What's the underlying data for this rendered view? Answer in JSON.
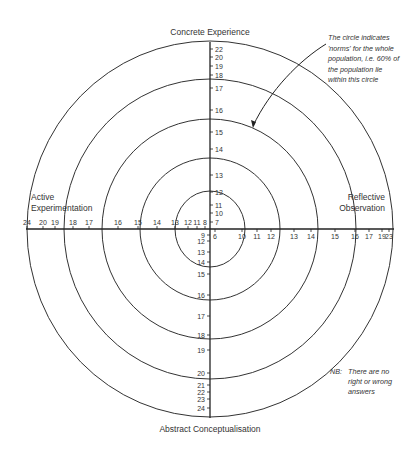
{
  "diagram": {
    "type": "learning-style-target",
    "center": {
      "x": 210,
      "y": 229
    },
    "circles": [
      {
        "rx": 35,
        "ry": 38
      },
      {
        "rx": 70,
        "ry": 71
      },
      {
        "rx": 108,
        "ry": 110
      },
      {
        "rx": 146,
        "ry": 150
      },
      {
        "rx": 183,
        "ry": 188
      }
    ],
    "axis_labels": {
      "top": "Concrete Experience",
      "bottom": "Abstract Conceptualisation",
      "left_line1": "Active",
      "left_line2": "Experimentation",
      "right_line1": "Reflective",
      "right_line2": "Observation"
    },
    "ticks": {
      "top": [
        {
          "label": "22",
          "y": 49
        },
        {
          "label": "20",
          "y": 57
        },
        {
          "label": "19",
          "y": 66
        },
        {
          "label": "18",
          "y": 75
        },
        {
          "label": "17",
          "y": 88
        },
        {
          "label": "16",
          "y": 110
        },
        {
          "label": "15",
          "y": 132
        },
        {
          "label": "14",
          "y": 149
        },
        {
          "label": "13",
          "y": 175
        },
        {
          "label": "12",
          "y": 192
        },
        {
          "label": "11",
          "y": 205
        },
        {
          "label": "10",
          "y": 213
        },
        {
          "label": "7",
          "y": 222
        }
      ],
      "bottom": [
        {
          "label": "9",
          "y": 235
        },
        {
          "label": "12",
          "y": 241
        },
        {
          "label": "13",
          "y": 252
        },
        {
          "label": "14",
          "y": 262
        },
        {
          "label": "15",
          "y": 274
        },
        {
          "label": "16",
          "y": 295
        },
        {
          "label": "17",
          "y": 316
        },
        {
          "label": "18",
          "y": 335
        },
        {
          "label": "19",
          "y": 350
        },
        {
          "label": "20",
          "y": 373
        },
        {
          "label": "21",
          "y": 385
        },
        {
          "label": "22",
          "y": 392
        },
        {
          "label": "23",
          "y": 399
        },
        {
          "label": "24",
          "y": 408
        }
      ],
      "left": [
        {
          "label": "24",
          "x": 27
        },
        {
          "label": "20",
          "x": 43
        },
        {
          "label": "19",
          "x": 55
        },
        {
          "label": "18",
          "x": 73
        },
        {
          "label": "17",
          "x": 89
        },
        {
          "label": "16",
          "x": 118
        },
        {
          "label": "15",
          "x": 138
        },
        {
          "label": "14",
          "x": 157
        },
        {
          "label": "13",
          "x": 175
        },
        {
          "label": "12",
          "x": 188
        },
        {
          "label": "11",
          "x": 197
        },
        {
          "label": "8",
          "x": 205
        }
      ],
      "right": [
        {
          "label": "6",
          "x": 215
        },
        {
          "label": "10",
          "x": 242
        },
        {
          "label": "11",
          "x": 257
        },
        {
          "label": "12",
          "x": 271
        },
        {
          "label": "13",
          "x": 294
        },
        {
          "label": "14",
          "x": 311
        },
        {
          "label": "15",
          "x": 335
        },
        {
          "label": "16",
          "x": 355
        },
        {
          "label": "17",
          "x": 369
        },
        {
          "label": "19",
          "x": 382
        },
        {
          "label": "23",
          "x": 389
        }
      ]
    },
    "annotation": {
      "lines": [
        "The circle indicates",
        "'norms' for the whole",
        "population, i.e. 60% of",
        "the population lie",
        "within this circle"
      ]
    },
    "note": {
      "prefix": "NB:",
      "lines": [
        "There are no",
        "right or wrong",
        "answers"
      ]
    },
    "colors": {
      "line": "#333333",
      "text": "#333333",
      "background": "#ffffff"
    }
  }
}
